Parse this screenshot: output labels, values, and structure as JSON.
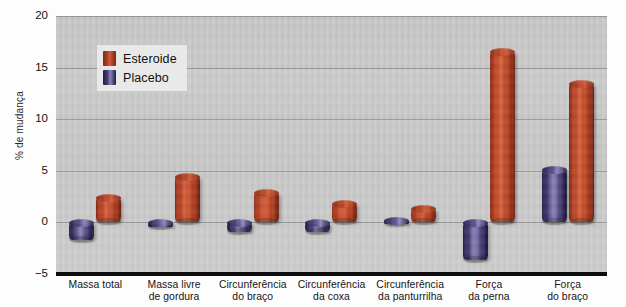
{
  "chart_data": {
    "type": "bar",
    "title": "",
    "xlabel": "",
    "ylabel": "% de mudança",
    "ylim": [
      -5,
      20
    ],
    "yticks": [
      20,
      15,
      10,
      5,
      0,
      -5
    ],
    "ytick_labels": [
      "20",
      "15",
      "10",
      "5",
      "0",
      "−5"
    ],
    "grid": true,
    "legend_position": "top-left",
    "categories": [
      "Massa total",
      "Massa livre de gordura",
      "Circunferência do braço",
      "Circunferência da coxa",
      "Circunferência da panturrilha",
      "Força da perna",
      "Força do braço"
    ],
    "category_lines": [
      [
        "Massa total"
      ],
      [
        "Massa livre",
        "de gordura"
      ],
      [
        "Circunferência",
        "do braço"
      ],
      [
        "Circunferência",
        "da coxa"
      ],
      [
        "Circunferência",
        "da panturrilha"
      ],
      [
        "Força",
        "da perna"
      ],
      [
        "Força",
        "do braço"
      ]
    ],
    "series": [
      {
        "name": "Placebo",
        "color": "#4b4180",
        "values": [
          -1.7,
          -0.4,
          -0.9,
          -0.9,
          0.2,
          -3.6,
          5.2
        ]
      },
      {
        "name": "Esteroide",
        "color": "#bc4528",
        "values": [
          2.5,
          4.5,
          2.9,
          1.9,
          1.4,
          16.6,
          13.5
        ]
      }
    ]
  },
  "legend": {
    "items": [
      {
        "label": "Esteroide",
        "key": "esteroide"
      },
      {
        "label": "Placebo",
        "key": "placebo"
      }
    ]
  },
  "axis": {
    "y_label": "% de mudança"
  }
}
